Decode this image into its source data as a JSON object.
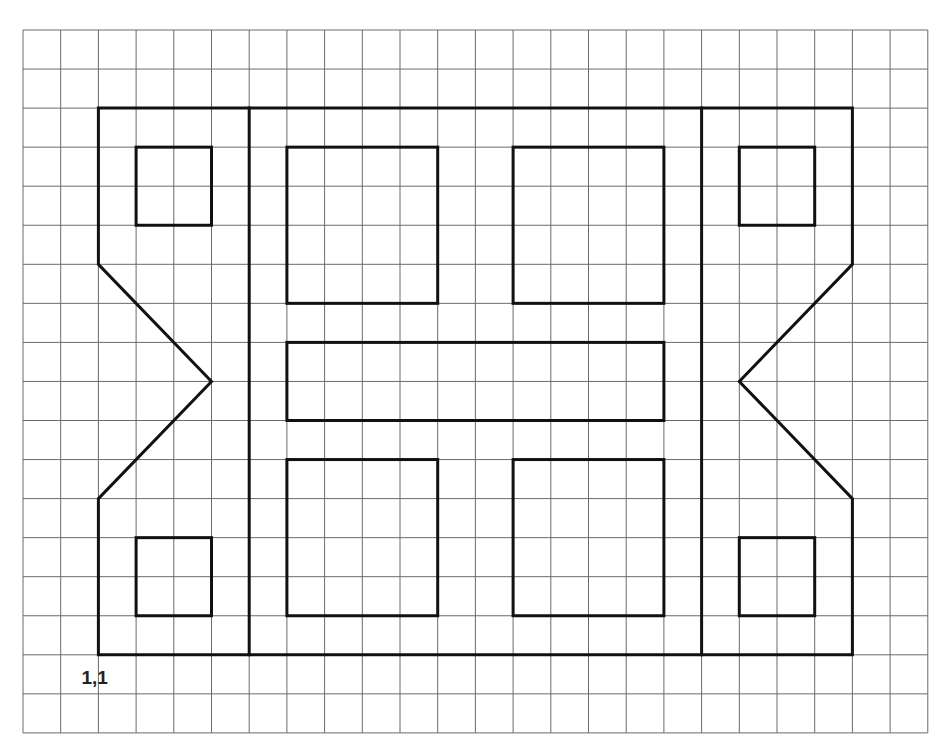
{
  "grid": {
    "origin_px": [
      23,
      30
    ],
    "cell_w": 37.7,
    "cell_h": 39.05,
    "cols": 24,
    "rows": 18,
    "line_color": "#6a6a6a"
  },
  "origin_label": {
    "text": "1,1",
    "col": 1.55,
    "row": 16.75
  },
  "shape_color": "#111111",
  "figure": {
    "outer_outline": [
      [
        2,
        2
      ],
      [
        22,
        2
      ],
      [
        22,
        6
      ],
      [
        19,
        9
      ],
      [
        22,
        12
      ],
      [
        22,
        16
      ],
      [
        2,
        16
      ],
      [
        2,
        12
      ],
      [
        5,
        9
      ],
      [
        2,
        6
      ]
    ],
    "dividers": [
      {
        "name": "left-divider",
        "col": 6,
        "row_from": 2,
        "row_to": 16
      },
      {
        "name": "right-divider",
        "col": 18,
        "row_from": 2,
        "row_to": 16
      }
    ],
    "rects": [
      {
        "name": "top-left-small-square",
        "x": 3,
        "y": 3,
        "w": 2,
        "h": 2
      },
      {
        "name": "top-right-small-square",
        "x": 19,
        "y": 3,
        "w": 2,
        "h": 2
      },
      {
        "name": "bottom-left-small-square",
        "x": 3,
        "y": 13,
        "w": 2,
        "h": 2
      },
      {
        "name": "bottom-right-small-square",
        "x": 19,
        "y": 13,
        "w": 2,
        "h": 2
      },
      {
        "name": "top-left-large-square",
        "x": 7,
        "y": 3,
        "w": 4,
        "h": 4
      },
      {
        "name": "top-right-large-square",
        "x": 13,
        "y": 3,
        "w": 4,
        "h": 4
      },
      {
        "name": "bottom-left-large-square",
        "x": 7,
        "y": 11,
        "w": 4,
        "h": 4
      },
      {
        "name": "bottom-right-large-square",
        "x": 13,
        "y": 11,
        "w": 4,
        "h": 4
      },
      {
        "name": "middle-bar",
        "x": 7,
        "y": 8,
        "w": 10,
        "h": 2
      }
    ]
  }
}
